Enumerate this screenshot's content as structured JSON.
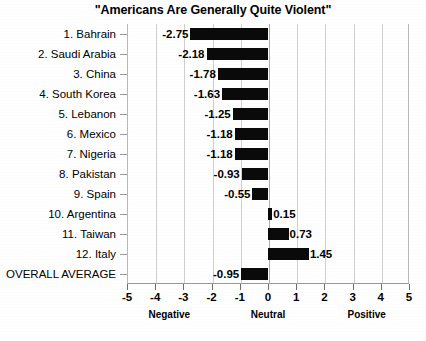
{
  "chart_data": {
    "type": "bar",
    "orientation": "horizontal",
    "title": "\"Americans Are Generally Quite Violent\"",
    "xlabel": "",
    "ylabel": "",
    "xlim": [
      -5,
      5
    ],
    "xticks": [
      "-5",
      "-4",
      "-3",
      "-2",
      "-1",
      "0",
      "1",
      "2",
      "3",
      "4",
      "5"
    ],
    "xtick_values": [
      -5,
      -4,
      -3,
      -2,
      -1,
      0,
      1,
      2,
      3,
      4,
      5
    ],
    "grid": true,
    "legend": "none",
    "bar_color": "#0a0a0a",
    "gridline_color": "#cfcfcf",
    "zone_labels": [
      {
        "text": "Negative",
        "at": -3.5
      },
      {
        "text": "Neutral",
        "at": 0
      },
      {
        "text": "Positive",
        "at": 3.5
      }
    ],
    "categories": [
      "1. Bahrain",
      "2. Saudi Arabia",
      "3. China",
      "4. South Korea",
      "5. Lebanon",
      "6. Mexico",
      "7. Nigeria",
      "8. Pakistan",
      "9. Spain",
      "10. Argentina",
      "11. Taiwan",
      "12. Italy",
      "OVERALL AVERAGE"
    ],
    "values": [
      -2.75,
      -2.18,
      -1.78,
      -1.63,
      -1.25,
      -1.18,
      -1.18,
      -0.93,
      -0.55,
      0.15,
      0.73,
      1.45,
      -0.95
    ],
    "value_labels": [
      "-2.75",
      "-2.18",
      "-1.78",
      "-1.63",
      "-1.25",
      "-1.18",
      "-1.18",
      "-0.93",
      "-0.55",
      "0.15",
      "0.73",
      "1.45",
      "-0.95"
    ]
  }
}
